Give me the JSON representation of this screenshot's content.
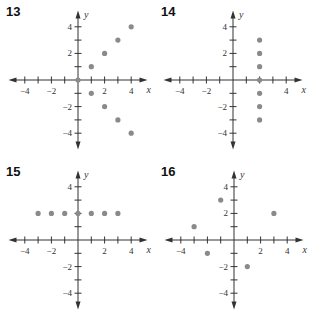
{
  "chart_data": [
    {
      "id": "13",
      "type": "scatter",
      "title": "13",
      "xlabel": "x",
      "ylabel": "y",
      "xlim": [
        -5,
        5
      ],
      "ylim": [
        -5,
        5
      ],
      "x_tick_labels": [
        "-4",
        "-2",
        "2",
        "4"
      ],
      "y_tick_labels": [
        "4",
        "2",
        "-2",
        "-4"
      ],
      "grid": false,
      "points": [
        [
          0,
          0
        ],
        [
          1,
          1
        ],
        [
          1,
          -1
        ],
        [
          2,
          2
        ],
        [
          2,
          -2
        ],
        [
          3,
          3
        ],
        [
          3,
          -3
        ],
        [
          4,
          4
        ],
        [
          4,
          -4
        ]
      ]
    },
    {
      "id": "14",
      "type": "scatter",
      "title": "14",
      "xlabel": "x",
      "ylabel": "y",
      "xlim": [
        -5,
        5
      ],
      "ylim": [
        -5,
        5
      ],
      "x_tick_labels": [
        "-4",
        "-2",
        "4"
      ],
      "y_tick_labels": [
        "4",
        "2",
        "-2",
        "-4"
      ],
      "grid": false,
      "points": [
        [
          2,
          3
        ],
        [
          2,
          2
        ],
        [
          2,
          1
        ],
        [
          2,
          0
        ],
        [
          2,
          -1
        ],
        [
          2,
          -2
        ],
        [
          2,
          -3
        ]
      ]
    },
    {
      "id": "15",
      "type": "scatter",
      "title": "15",
      "xlabel": "x",
      "ylabel": "y",
      "xlim": [
        -5,
        5
      ],
      "ylim": [
        -5,
        5
      ],
      "x_tick_labels": [
        "-4",
        "-2",
        "2",
        "4"
      ],
      "y_tick_labels": [
        "4",
        "-2",
        "-4"
      ],
      "grid": false,
      "points": [
        [
          -3,
          2
        ],
        [
          -2,
          2
        ],
        [
          -1,
          2
        ],
        [
          0,
          2
        ],
        [
          1,
          2
        ],
        [
          2,
          2
        ],
        [
          3,
          2
        ]
      ]
    },
    {
      "id": "16",
      "type": "scatter",
      "title": "16",
      "xlabel": "x",
      "ylabel": "y",
      "xlim": [
        -5,
        5
      ],
      "ylim": [
        -5,
        5
      ],
      "x_tick_labels": [
        "-4",
        "2",
        "4"
      ],
      "y_tick_labels": [
        "4",
        "2",
        "-2",
        "-4"
      ],
      "grid": false,
      "points": [
        [
          -3,
          1
        ],
        [
          -2,
          -1
        ],
        [
          -1,
          3
        ],
        [
          1,
          -2
        ],
        [
          3,
          2
        ]
      ]
    }
  ],
  "style": {
    "point_color": "#8a8a8a",
    "axis_color": "#333333"
  }
}
